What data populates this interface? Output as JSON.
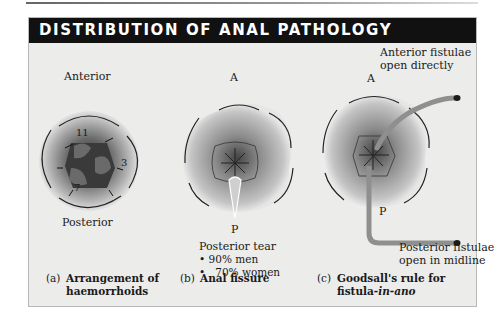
{
  "figure": {
    "title": "DISTRIBUTION OF ANAL PATHOLOGY",
    "colors": {
      "header_bg": "#111111",
      "panel_bg": "#ececeb",
      "fistula_tract": "#8f8f8f"
    }
  },
  "panel_a": {
    "top_label": "Anterior",
    "bottom_label": "Posterior",
    "positions": [
      "11",
      "3",
      "7"
    ],
    "caption_letter": "(a)",
    "caption_line1": "Arrangement of",
    "caption_line2": "haemorrhoids"
  },
  "panel_b": {
    "top_label": "A",
    "bottom_label": "P",
    "note_title": "Posterior tear",
    "bullets": [
      "90% men",
      "70% women"
    ],
    "caption_letter": "(b)",
    "caption_line1": "Anal fissure"
  },
  "panel_c": {
    "top_label": "A",
    "bottom_label": "P",
    "anterior_note_line1": "Anterior fistulae",
    "anterior_note_line2": "open directly",
    "posterior_note_line1": "Posterior fistulae",
    "posterior_note_line2": "open in midline",
    "caption_letter": "(c)",
    "caption_line1": "Goodsall's rule for",
    "caption_line2_prefix": "fistula-",
    "caption_line2_italic": "in-ano"
  }
}
